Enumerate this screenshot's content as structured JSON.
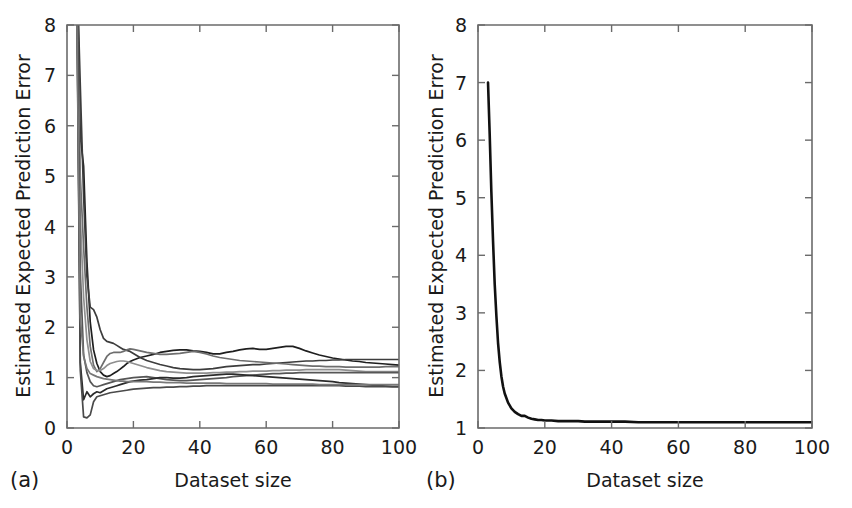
{
  "figure": {
    "title": "",
    "background": "#ffffff",
    "panels": [
      {
        "tag": "(a)",
        "name": "panel-a"
      },
      {
        "tag": "(b)",
        "name": "panel-b"
      }
    ]
  },
  "chart_data": [
    {
      "type": "line",
      "panel": "(a)",
      "title": "",
      "xlabel": "Dataset size",
      "ylabel": "Estimated Expected Prediction Error",
      "xlim": [
        0,
        100
      ],
      "ylim": [
        0,
        8
      ],
      "xticks": [
        0,
        20,
        40,
        60,
        80,
        100
      ],
      "yticks": [
        0,
        1,
        2,
        3,
        4,
        5,
        6,
        7,
        8
      ],
      "xtick_labels": [
        "0",
        "20",
        "40",
        "60",
        "80",
        "100"
      ],
      "ytick_labels": [
        "0",
        "1",
        "2",
        "3",
        "4",
        "5",
        "6",
        "7",
        "8"
      ],
      "grid": false,
      "legend": "none",
      "note": "Eight greyscale repeat runs of estimated expected prediction error versus dataset size; all runs spike or dip violently for dataset sizes under about 12 then converge toward roughly 0.8 to 1.4.",
      "x": [
        3,
        4,
        5,
        6,
        7,
        8,
        9,
        10,
        11,
        12,
        13,
        14,
        15,
        16,
        17,
        18,
        19,
        20,
        22,
        24,
        26,
        28,
        30,
        32,
        34,
        36,
        38,
        40,
        42,
        44,
        46,
        48,
        50,
        52,
        54,
        56,
        58,
        60,
        62,
        64,
        66,
        68,
        70,
        72,
        74,
        76,
        78,
        80,
        82,
        84,
        86,
        88,
        90,
        92,
        94,
        96,
        98,
        100
      ],
      "series": [
        {
          "name": "run-1",
          "color": "#1f1f1f",
          "values": [
            9.4,
            5.8,
            5.2,
            3.3,
            2.1,
            1.55,
            1.28,
            1.12,
            1.05,
            1.02,
            1.04,
            1.08,
            1.12,
            1.17,
            1.22,
            1.28,
            1.32,
            1.35,
            1.4,
            1.43,
            1.46,
            1.5,
            1.52,
            1.54,
            1.55,
            1.55,
            1.53,
            1.52,
            1.5,
            1.47,
            1.47,
            1.5,
            1.52,
            1.55,
            1.57,
            1.58,
            1.56,
            1.56,
            1.58,
            1.6,
            1.62,
            1.62,
            1.58,
            1.53,
            1.49,
            1.45,
            1.42,
            1.39,
            1.37,
            1.35,
            1.33,
            1.32,
            1.3,
            1.29,
            1.28,
            1.27,
            1.26,
            1.25
          ]
        },
        {
          "name": "run-2",
          "color": "#3d3d3d",
          "values": [
            9.1,
            6.8,
            4.6,
            3.0,
            2.4,
            2.35,
            2.2,
            1.95,
            1.78,
            1.72,
            1.7,
            1.68,
            1.64,
            1.6,
            1.56,
            1.54,
            1.52,
            1.48,
            1.4,
            1.34,
            1.3,
            1.26,
            1.23,
            1.2,
            1.18,
            1.17,
            1.16,
            1.16,
            1.17,
            1.18,
            1.2,
            1.22,
            1.23,
            1.24,
            1.25,
            1.26,
            1.26,
            1.27,
            1.28,
            1.29,
            1.3,
            1.31,
            1.32,
            1.33,
            1.33,
            1.34,
            1.34,
            1.35,
            1.35,
            1.36,
            1.36,
            1.36,
            1.36,
            1.36,
            1.36,
            1.36,
            1.36,
            1.36
          ]
        },
        {
          "name": "run-3",
          "color": "#6e6e6e",
          "values": [
            8.7,
            5.0,
            3.6,
            2.4,
            1.62,
            1.25,
            1.12,
            1.18,
            1.3,
            1.42,
            1.48,
            1.5,
            1.5,
            1.5,
            1.52,
            1.55,
            1.57,
            1.56,
            1.53,
            1.5,
            1.48,
            1.46,
            1.46,
            1.47,
            1.48,
            1.5,
            1.52,
            1.5,
            1.47,
            1.43,
            1.4,
            1.38,
            1.36,
            1.34,
            1.33,
            1.32,
            1.31,
            1.3,
            1.29,
            1.28,
            1.27,
            1.26,
            1.25,
            1.24,
            1.23,
            1.23,
            1.22,
            1.22,
            1.22,
            1.21,
            1.21,
            1.21,
            1.21,
            1.21,
            1.21,
            1.22,
            1.22,
            1.22
          ]
        },
        {
          "name": "run-4",
          "color": "#8f8f8f",
          "values": [
            8.3,
            4.2,
            2.6,
            1.75,
            1.32,
            1.18,
            1.14,
            1.14,
            1.18,
            1.24,
            1.28,
            1.3,
            1.32,
            1.33,
            1.33,
            1.32,
            1.3,
            1.28,
            1.24,
            1.2,
            1.17,
            1.14,
            1.12,
            1.11,
            1.1,
            1.09,
            1.09,
            1.09,
            1.09,
            1.1,
            1.1,
            1.11,
            1.11,
            1.12,
            1.12,
            1.13,
            1.13,
            1.13,
            1.14,
            1.14,
            1.15,
            1.15,
            1.15,
            1.16,
            1.16,
            1.16,
            1.16,
            1.16,
            1.16,
            1.15,
            1.14,
            1.13,
            1.12,
            1.12,
            1.12,
            1.12,
            1.12,
            1.12
          ]
        },
        {
          "name": "run-5",
          "color": "#565656",
          "values": [
            8.9,
            3.1,
            1.45,
            1.1,
            0.92,
            0.84,
            0.82,
            0.84,
            0.86,
            0.88,
            0.9,
            0.92,
            0.94,
            0.96,
            0.97,
            0.98,
            0.99,
            1.0,
            1.01,
            1.02,
            1.0,
            0.98,
            0.96,
            0.95,
            0.94,
            0.94,
            0.95,
            0.96,
            0.97,
            0.98,
            0.99,
            1.0,
            1.02,
            1.03,
            1.04,
            1.05,
            1.06,
            1.07,
            1.08,
            1.08,
            1.09,
            1.09,
            1.1,
            1.1,
            1.1,
            1.1,
            1.1,
            1.1,
            1.1,
            1.1,
            1.1,
            1.1,
            1.1,
            1.1,
            1.1,
            1.1,
            1.1,
            1.1
          ]
        },
        {
          "name": "run-6",
          "color": "#2b2b2b",
          "values": [
            8.6,
            1.3,
            0.56,
            0.72,
            0.62,
            0.68,
            0.72,
            0.7,
            0.74,
            0.78,
            0.8,
            0.82,
            0.84,
            0.86,
            0.88,
            0.9,
            0.92,
            0.93,
            0.95,
            0.96,
            0.98,
            1.0,
            1.0,
            0.99,
            0.99,
            1.0,
            1.02,
            1.03,
            1.04,
            1.05,
            1.06,
            1.07,
            1.07,
            1.06,
            1.05,
            1.04,
            1.03,
            1.02,
            1.01,
            1.0,
            0.99,
            0.98,
            0.97,
            0.96,
            0.95,
            0.94,
            0.93,
            0.92,
            0.9,
            0.89,
            0.88,
            0.87,
            0.86,
            0.85,
            0.84,
            0.83,
            0.82,
            0.82
          ]
        },
        {
          "name": "run-7",
          "color": "#4a4a4a",
          "values": [
            8.2,
            1.15,
            0.22,
            0.2,
            0.26,
            0.52,
            0.62,
            0.64,
            0.66,
            0.68,
            0.7,
            0.71,
            0.72,
            0.73,
            0.74,
            0.75,
            0.76,
            0.77,
            0.78,
            0.79,
            0.8,
            0.8,
            0.81,
            0.81,
            0.82,
            0.82,
            0.83,
            0.83,
            0.84,
            0.84,
            0.84,
            0.84,
            0.84,
            0.84,
            0.84,
            0.84,
            0.84,
            0.84,
            0.84,
            0.84,
            0.84,
            0.84,
            0.84,
            0.84,
            0.84,
            0.84,
            0.84,
            0.84,
            0.84,
            0.83,
            0.83,
            0.83,
            0.82,
            0.82,
            0.82,
            0.82,
            0.82,
            0.82
          ]
        },
        {
          "name": "run-8",
          "color": "#787878",
          "values": [
            8.0,
            2.2,
            1.42,
            1.18,
            1.08,
            1.05,
            1.02,
            1.0,
            0.98,
            0.97,
            0.96,
            0.95,
            0.94,
            0.93,
            0.93,
            0.92,
            0.92,
            0.92,
            0.92,
            0.92,
            0.91,
            0.91,
            0.9,
            0.9,
            0.9,
            0.89,
            0.89,
            0.89,
            0.89,
            0.89,
            0.89,
            0.88,
            0.88,
            0.88,
            0.88,
            0.88,
            0.88,
            0.88,
            0.87,
            0.87,
            0.87,
            0.87,
            0.87,
            0.87,
            0.87,
            0.86,
            0.86,
            0.86,
            0.86,
            0.86,
            0.86,
            0.86,
            0.86,
            0.86,
            0.86,
            0.86,
            0.86,
            0.86
          ]
        }
      ]
    },
    {
      "type": "line",
      "panel": "(b)",
      "title": "",
      "xlabel": "Dataset size",
      "ylabel": "Estimated Expected Prediction Error",
      "xlim": [
        0,
        100
      ],
      "ylim": [
        1,
        8
      ],
      "xticks": [
        0,
        20,
        40,
        60,
        80,
        100
      ],
      "yticks": [
        1,
        2,
        3,
        4,
        5,
        6,
        7,
        8
      ],
      "xtick_labels": [
        "0",
        "20",
        "40",
        "60",
        "80",
        "100"
      ],
      "ytick_labels": [
        "1",
        "2",
        "3",
        "4",
        "5",
        "6",
        "7",
        "8"
      ],
      "grid": false,
      "legend": "none",
      "note": "Single averaged curve starting at about 7.0 at dataset size 3 and decaying sharply to an asymptote near 1.1.",
      "x": [
        3,
        3.5,
        4,
        4.5,
        5,
        5.5,
        6,
        6.5,
        7,
        7.5,
        8,
        9,
        10,
        11,
        12,
        13,
        14,
        15,
        16,
        17,
        18,
        19,
        20,
        22,
        24,
        26,
        28,
        30,
        32,
        34,
        36,
        38,
        40,
        44,
        48,
        52,
        56,
        60,
        64,
        68,
        72,
        76,
        80,
        84,
        88,
        92,
        96,
        100
      ],
      "series": [
        {
          "name": "expected-error",
          "color": "#111111",
          "thick": true,
          "values": [
            7.0,
            6.1,
            5.1,
            4.25,
            3.5,
            2.95,
            2.48,
            2.15,
            1.9,
            1.72,
            1.6,
            1.44,
            1.34,
            1.28,
            1.24,
            1.21,
            1.21,
            1.18,
            1.16,
            1.15,
            1.14,
            1.14,
            1.13,
            1.13,
            1.12,
            1.12,
            1.12,
            1.12,
            1.11,
            1.11,
            1.11,
            1.11,
            1.11,
            1.11,
            1.1,
            1.1,
            1.1,
            1.1,
            1.1,
            1.1,
            1.1,
            1.1,
            1.1,
            1.1,
            1.1,
            1.1,
            1.1,
            1.1
          ]
        }
      ]
    }
  ]
}
